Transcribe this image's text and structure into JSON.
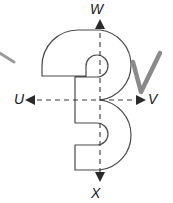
{
  "figure": {
    "background_color": "#ffffff",
    "width": 173,
    "height": 203
  },
  "shape": {
    "name": "numeral-three-outline",
    "description": "Outline of the digit 3 centred on the origin of a dashed axis cross",
    "stroke_color": "#4a4a4a",
    "fill_color": "#ffffff",
    "stroke_width": 1.2
  },
  "axes": {
    "stroke_color": "#3a3a3a",
    "dash_pattern": "5,4",
    "origin": {
      "x": 100,
      "y": 100
    },
    "vertical": {
      "name": "vertical-axis",
      "top_y": 22,
      "bottom_y": 178
    },
    "horizontal": {
      "name": "horizontal-axis",
      "left_x": 26,
      "right_x": 140
    }
  },
  "labels": {
    "top": "W",
    "bottom": "X",
    "left": "U",
    "right": "V"
  },
  "annotations": {
    "check_mark": {
      "name": "check-mark",
      "color": "#8a8a8a",
      "stroke_width": 4.5
    },
    "corner_stroke": {
      "name": "partial-stroke",
      "color": "#9a9a9a",
      "stroke_width": 3
    }
  }
}
